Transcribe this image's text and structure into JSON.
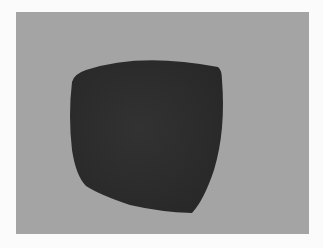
{
  "scene": {
    "background_color": "#a4a4a4",
    "frame_color": "#fbfbfb",
    "surface": {
      "type": "curved-quad-patch",
      "fill_color": "#2d2d2d",
      "shade_color": "#262626",
      "corners": {
        "top_left": [
          72,
          78
        ],
        "top_right": [
          220,
          69
        ],
        "bottom_right": [
          192,
          213
        ],
        "bottom_left": [
          78,
          172
        ]
      }
    }
  }
}
